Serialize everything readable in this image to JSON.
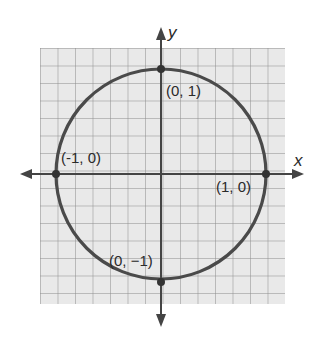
{
  "diagram": {
    "axes": {
      "x_label": "x",
      "y_label": "y"
    },
    "points": [
      {
        "label": "(0, 1)",
        "x": 0,
        "y": 1
      },
      {
        "label": "(-1, 0)",
        "x": -1,
        "y": 0
      },
      {
        "label": "(1, 0)",
        "x": 1,
        "y": 0
      },
      {
        "label": "(0, −1)",
        "x": 0,
        "y": -1
      }
    ],
    "circle": {
      "center": [
        0,
        0
      ],
      "radius": 1
    },
    "grid": {
      "cells_per_unit": 6
    },
    "colors": {
      "grid_bg": "#e9e9e9",
      "grid_line": "#8a8a8a",
      "curve": "#4a4a4a",
      "axis": "#444444"
    }
  }
}
